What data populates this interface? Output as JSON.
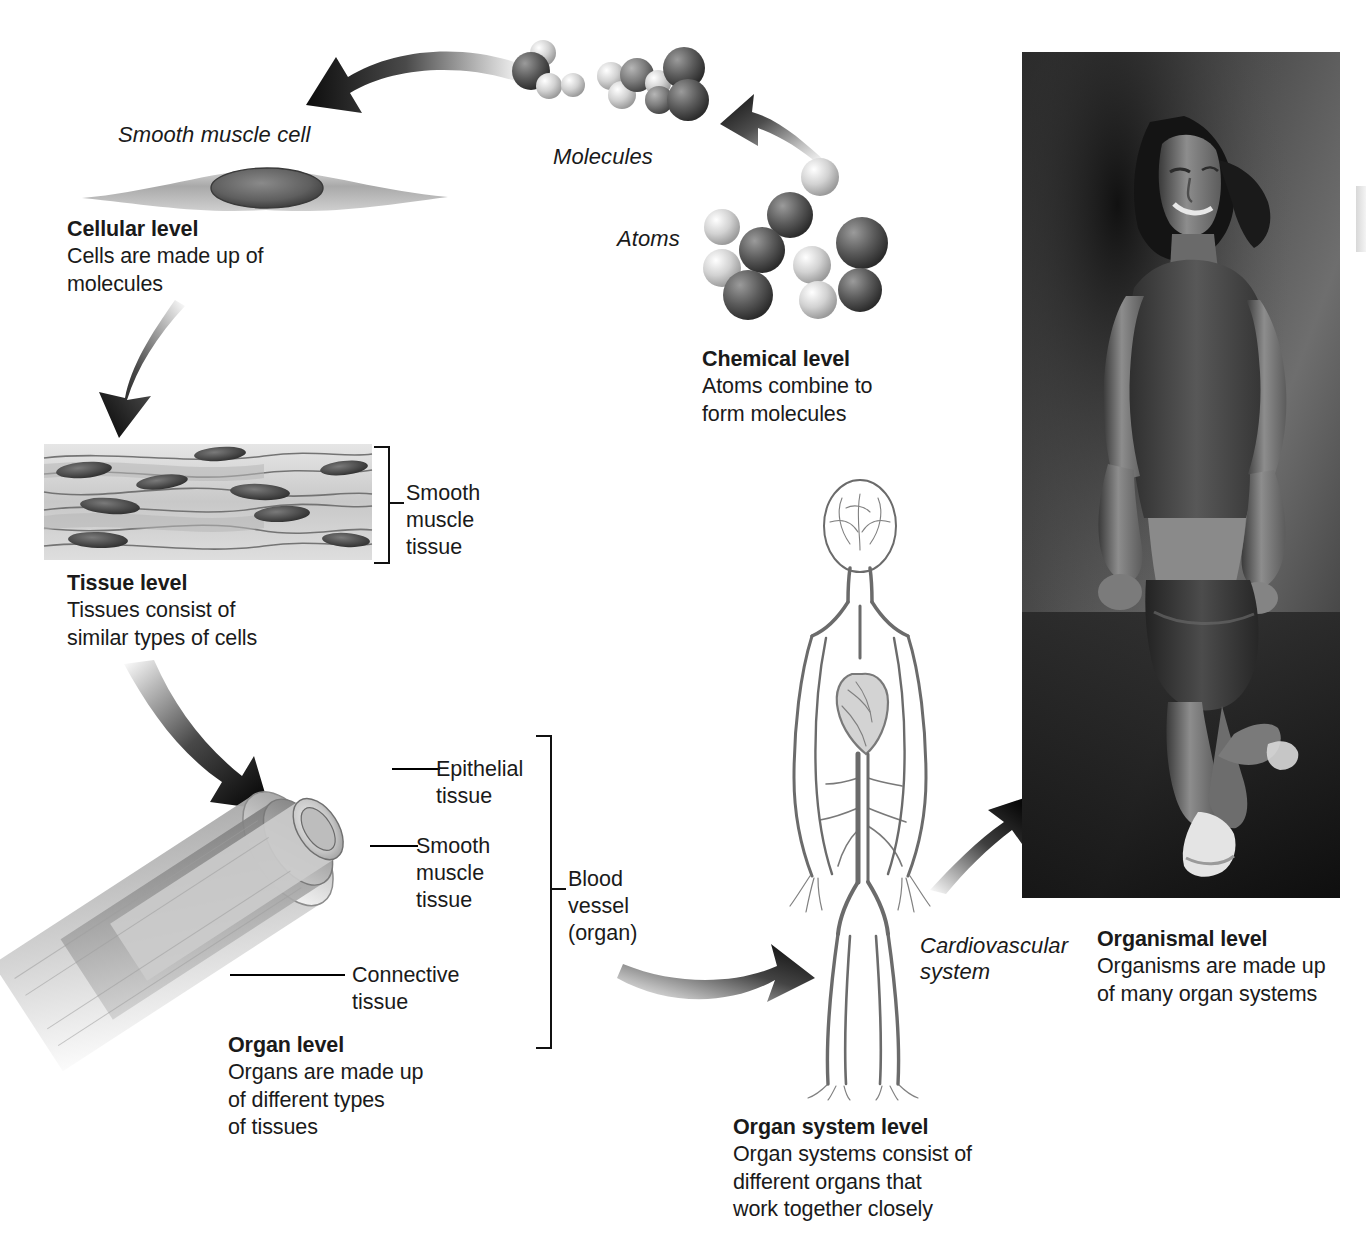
{
  "figure": {
    "levels": [
      {
        "id": "chemical",
        "heading": "Chemical level",
        "body": "Atoms combine to\nform molecules",
        "body_lines": [
          "Atoms combine to",
          "form molecules"
        ]
      },
      {
        "id": "cellular",
        "heading": "Cellular level",
        "body_lines": [
          "Cells are made up of",
          "molecules"
        ]
      },
      {
        "id": "tissue",
        "heading": "Tissue level",
        "body_lines": [
          "Tissues consist of",
          "similar types of cells"
        ]
      },
      {
        "id": "organ",
        "heading": "Organ level",
        "body_lines": [
          "Organs are made up",
          "of different types",
          "of tissues"
        ]
      },
      {
        "id": "organ-system",
        "heading": "Organ system level",
        "body_lines": [
          "Organ systems consist of",
          "different organs that",
          "work together closely"
        ]
      },
      {
        "id": "organismal",
        "heading": "Organismal level",
        "body_lines": [
          "Organisms are made up",
          "of many organ systems"
        ]
      }
    ],
    "italic_labels": {
      "smooth_muscle_cell": "Smooth muscle cell",
      "molecules": "Molecules",
      "atoms": "Atoms",
      "cardiovascular_system": "Cardiovascular\nsystem",
      "cardiovascular_system_lines": [
        "Cardiovascular",
        "system"
      ]
    },
    "callouts": {
      "smooth_muscle_tissue_lines": [
        "Smooth",
        "muscle",
        "tissue"
      ],
      "epithelial_tissue_lines": [
        "Epithelial",
        "tissue"
      ],
      "vessel_smooth_muscle_lines": [
        "Smooth",
        "muscle",
        "tissue"
      ],
      "connective_tissue_lines": [
        "Connective",
        "tissue"
      ],
      "blood_vessel_lines": [
        "Blood",
        "vessel",
        "(organ)"
      ]
    },
    "colors": {
      "text": "#1a1a1a",
      "arrow": "#111111",
      "background": "#ffffff"
    }
  }
}
